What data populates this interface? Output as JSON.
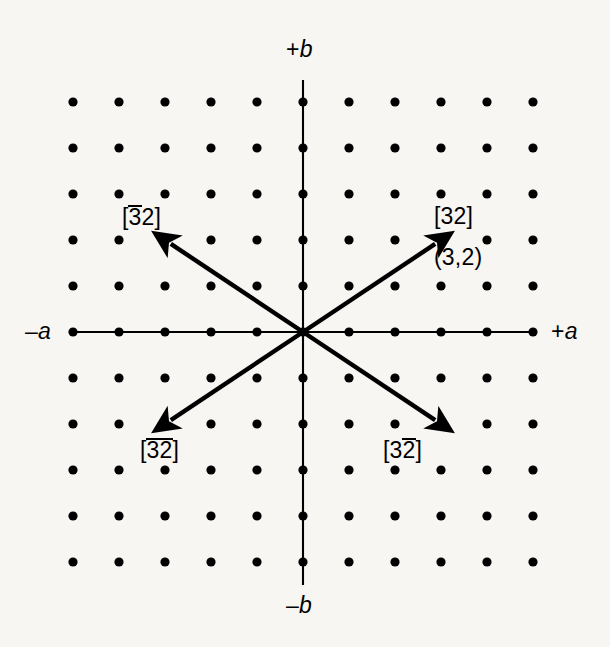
{
  "figure": {
    "type": "crystallographic-lattice-direction-diagram",
    "background_color": "#f7f6f3",
    "ink_color": "#000000"
  },
  "axes": {
    "x_positive": {
      "sign": "+",
      "symbol": "a"
    },
    "x_negative": {
      "sign": "–",
      "symbol": "a"
    },
    "y_positive": {
      "sign": "+",
      "symbol": "b"
    },
    "y_negative": {
      "sign": "–",
      "symbol": "b"
    }
  },
  "vectors": [
    {
      "name": "upper-right",
      "index_open": "[",
      "index_close": "]",
      "first_digit": "3",
      "first_bar": false,
      "second_digit": "2",
      "second_bar": false,
      "coordinate": "(3,2)",
      "tip_lattice": [
        3,
        2
      ]
    },
    {
      "name": "upper-left",
      "index_open": "[",
      "index_close": "]",
      "first_digit": "3",
      "first_bar": true,
      "second_digit": "2",
      "second_bar": false,
      "tip_lattice": [
        -3,
        2
      ]
    },
    {
      "name": "lower-left",
      "index_open": "[",
      "index_close": "]",
      "first_digit": "3",
      "first_bar": true,
      "second_digit": "2",
      "second_bar": true,
      "tip_lattice": [
        -3,
        -2
      ]
    },
    {
      "name": "lower-right",
      "index_open": "[",
      "index_close": "]",
      "first_digit": "3",
      "first_bar": false,
      "second_digit": "2",
      "second_bar": true,
      "tip_lattice": [
        3,
        -2
      ]
    }
  ],
  "chart_data": {
    "type": "scatter",
    "title": "",
    "xlabel": "a",
    "ylabel": "b",
    "grid": false,
    "legend": null,
    "lattice": {
      "origin_px": [
        303,
        332
      ],
      "spacing_px": 46,
      "columns": 11,
      "rows": 11,
      "x_range": [
        -5,
        5
      ],
      "y_range": [
        -5,
        5
      ],
      "dot_radius_px": 4.6,
      "dot_color": "#000000"
    },
    "annotations": [
      {
        "text": "[32]",
        "x": 3,
        "y": 2
      },
      {
        "text": "(3,2)",
        "x": 3,
        "y": 2
      },
      {
        "text": "[̲3̲2]",
        "x": -3,
        "y": 2
      },
      {
        "text": "[̲3̲2]",
        "x": -3,
        "y": -2
      },
      {
        "text": "[3̲2]",
        "x": 3,
        "y": -2
      }
    ],
    "arrows": [
      {
        "from": [
          0,
          0
        ],
        "to": [
          3,
          2
        ]
      },
      {
        "from": [
          0,
          0
        ],
        "to": [
          -3,
          2
        ]
      },
      {
        "from": [
          0,
          0
        ],
        "to": [
          -3,
          -2
        ]
      },
      {
        "from": [
          0,
          0
        ],
        "to": [
          3,
          -2
        ]
      }
    ]
  }
}
